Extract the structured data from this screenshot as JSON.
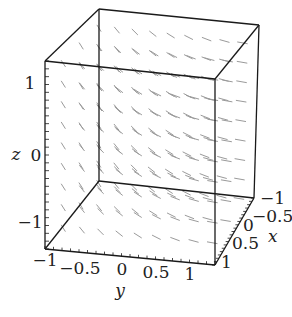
{
  "chart_data": {
    "type": "vector_field_3d",
    "title": "",
    "axes": {
      "x": {
        "label": "x",
        "range": [
          -1,
          1
        ],
        "ticks": [
          -1,
          -0.5,
          0,
          0.5,
          1
        ],
        "tick_labels": [
          "−1",
          "−0.5",
          "0",
          "0.5",
          "1"
        ]
      },
      "y": {
        "label": "y",
        "range": [
          -1,
          1
        ],
        "ticks": [
          -1,
          -0.5,
          0,
          0.5,
          1
        ],
        "tick_labels": [
          "−1",
          "−0.5",
          "0",
          "0.5",
          "1"
        ]
      },
      "z": {
        "label": "z",
        "range": [
          -1.2,
          1.2
        ],
        "ticks": [
          1,
          0,
          -1
        ],
        "tick_labels": [
          "1",
          "0",
          "−1"
        ]
      }
    },
    "box": true,
    "grid": false,
    "legend": null,
    "arrow_color": "#9a9a9a",
    "box_color": "#1a1a1a"
  },
  "colors": {
    "background": "#ffffff",
    "box": "#1a1a1a",
    "arrows": "#9a9a9a",
    "text": "#222222"
  }
}
